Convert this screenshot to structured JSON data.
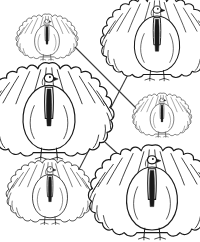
{
  "page": {
    "background_color": "#ffffff",
    "width": 200,
    "height": 242,
    "ink_color": "#1a1a1a",
    "line_color": "#3a3a3a"
  },
  "figures": [
    {
      "id": "turkey-top-left",
      "label": "Turkey",
      "position": "top-left",
      "size_rank": "smallest",
      "cx": 47,
      "cy": 38,
      "scale": 0.44
    },
    {
      "id": "turkey-top-right",
      "label": "Turkey",
      "position": "top-right",
      "size_rank": "large",
      "cx": 157,
      "cy": 40,
      "scale": 0.8
    },
    {
      "id": "turkey-middle-left",
      "label": "Turkey",
      "position": "middle-left",
      "size_rank": "largest",
      "cx": 49,
      "cy": 113,
      "scale": 0.92
    },
    {
      "id": "turkey-middle-right",
      "label": "Turkey",
      "position": "middle-right",
      "size_rank": "small",
      "cx": 162,
      "cy": 116,
      "scale": 0.42
    },
    {
      "id": "turkey-bottom-left",
      "label": "Turkey",
      "position": "bottom-left",
      "size_rank": "medium",
      "cx": 50,
      "cy": 193,
      "scale": 0.62
    },
    {
      "id": "turkey-bottom-right",
      "label": "Turkey",
      "position": "bottom-right",
      "size_rank": "largest",
      "cx": 152,
      "cy": 194,
      "scale": 0.9
    }
  ],
  "connections": [
    {
      "id": "line-topleft-to-middleright",
      "from": "turkey-top-left",
      "to": "turkey-middle-right",
      "x1": 65,
      "y1": 37,
      "x2": 141,
      "y2": 113
    },
    {
      "id": "line-topright-to-bottomleft",
      "from": "turkey-top-right",
      "to": "turkey-bottom-left",
      "x1": 136,
      "y1": 59,
      "x2": 73,
      "y2": 181
    },
    {
      "id": "line-middleleft-to-bottomright",
      "from": "turkey-middle-left",
      "to": "turkey-bottom-right",
      "x1": 82,
      "y1": 121,
      "x2": 131,
      "y2": 166
    }
  ]
}
